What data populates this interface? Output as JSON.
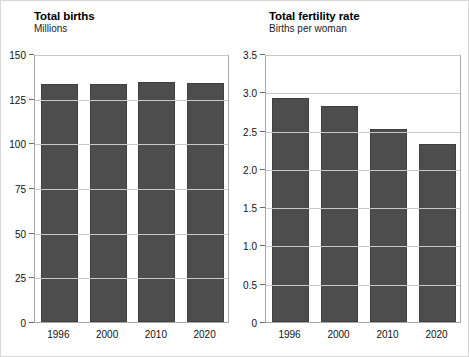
{
  "figure": {
    "background_color": "#ffffff",
    "bar_color": "#4d4d4d",
    "gridline_color": "#c9c9c9",
    "axis_color": "#a8a8a8"
  },
  "chart_data": [
    {
      "type": "bar",
      "panel": "left",
      "title": "Total births",
      "subtitle": "Millions",
      "xlabel": "",
      "ylabel": "Millions",
      "categories": [
        "1996",
        "2000",
        "2010",
        "2020"
      ],
      "values": [
        133,
        133,
        134.5,
        134
      ],
      "ylim": [
        0,
        150
      ],
      "yticks": [
        0,
        25,
        50,
        75,
        100,
        125,
        150
      ],
      "ytick_labels": [
        "0",
        "25",
        "50",
        "75",
        "100",
        "125",
        "150"
      ],
      "grid": true,
      "legend": "none"
    },
    {
      "type": "bar",
      "panel": "right",
      "title": "Total fertility rate",
      "subtitle": "Births per woman",
      "xlabel": "",
      "ylabel": "Births per woman",
      "categories": [
        "1996",
        "2000",
        "2010",
        "2020"
      ],
      "values": [
        2.93,
        2.82,
        2.52,
        2.33
      ],
      "ylim": [
        0,
        3.5
      ],
      "yticks": [
        0,
        0.5,
        1.0,
        1.5,
        2.0,
        2.5,
        3.0,
        3.5
      ],
      "ytick_labels": [
        "0",
        "0.5",
        "1.0",
        "1.5",
        "2.0",
        "2.5",
        "3.0",
        "3.5"
      ],
      "grid": true,
      "legend": "none"
    }
  ]
}
